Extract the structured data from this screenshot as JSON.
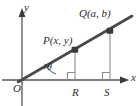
{
  "figure": {
    "axes": {
      "x_label": "x",
      "y_label": "y",
      "origin_label": "O"
    },
    "points": [
      {
        "id": "P",
        "label": "P(x, y)",
        "x_px": 75,
        "y_px": 50
      },
      {
        "id": "Q",
        "label": "Q(a, b)",
        "x_px": 110,
        "y_px": 31
      }
    ],
    "feet": [
      {
        "id": "R",
        "label": "R",
        "x_px": 75,
        "y_px": 80
      },
      {
        "id": "S",
        "label": "S",
        "x_px": 110,
        "y_px": 80
      }
    ],
    "angle": {
      "label": "θ",
      "vertex_label": "O"
    },
    "colors": {
      "ray": "#4a4a4a",
      "axis": "#555555",
      "drop_line": "#8d8d8d",
      "right_angle": "#8d8d8d",
      "text": "#2b2b2b",
      "background": "#ffffff"
    }
  }
}
